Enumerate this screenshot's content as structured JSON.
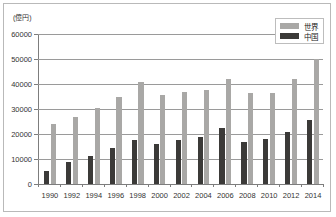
{
  "chart_data": {
    "type": "bar",
    "title": "",
    "subtitle": "",
    "xlabel": "",
    "ylabel": "(億円)",
    "unit_label": "(億円)",
    "ylim": [
      0,
      60000
    ],
    "ytick_step": 10000,
    "yticks": [
      "0",
      "10000",
      "20000",
      "30000",
      "40000",
      "50000",
      "60000"
    ],
    "ytick_values": [
      0,
      10000,
      20000,
      30000,
      40000,
      50000,
      60000
    ],
    "grid": true,
    "grid_axis": "y",
    "legend_position": "top-right",
    "categories": [
      "1990",
      "1992",
      "1994",
      "1996",
      "1998",
      "2000",
      "2002",
      "2004",
      "2006",
      "2008",
      "2010",
      "2012",
      "2014"
    ],
    "series": [
      {
        "name": "中国",
        "color": "#3b3a38",
        "order_in_group": 1,
        "values": [
          5300,
          8700,
          11300,
          14600,
          17800,
          16200,
          17700,
          18800,
          22500,
          16900,
          18200,
          20800,
          25500
        ]
      },
      {
        "name": "世界",
        "color": "#a9a8a6",
        "order_in_group": 2,
        "values": [
          24000,
          26800,
          30400,
          34700,
          40800,
          35700,
          36700,
          37600,
          42200,
          36600,
          36600,
          42200,
          50000
        ]
      }
    ]
  },
  "legend": {
    "items": [
      {
        "label": "世界",
        "color": "#a9a8a6"
      },
      {
        "label": "中国",
        "color": "#3b3a38"
      }
    ]
  }
}
